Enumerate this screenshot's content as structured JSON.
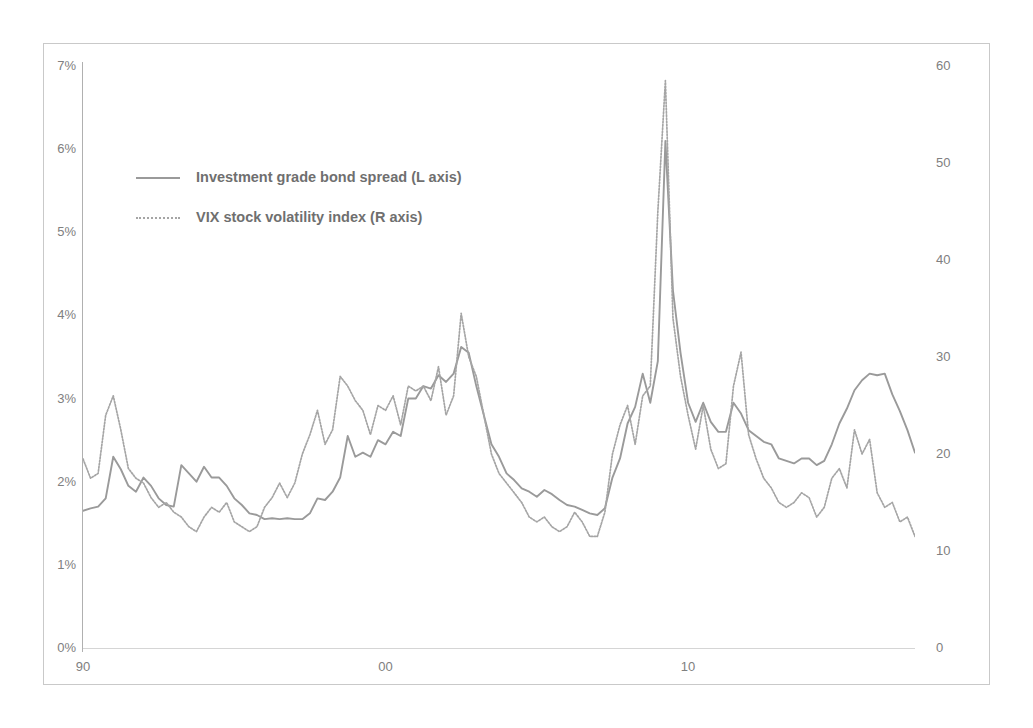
{
  "chart_data": {
    "type": "line",
    "title": "",
    "subtitle": "",
    "xlabel": "",
    "ylabel": "",
    "y2label": "",
    "grid": false,
    "legend_position": "inside-top-left",
    "x": [
      1990.0,
      1990.25,
      1990.5,
      1990.75,
      1991.0,
      1991.25,
      1991.5,
      1991.75,
      1992.0,
      1992.25,
      1992.5,
      1992.75,
      1993.0,
      1993.25,
      1993.5,
      1993.75,
      1994.0,
      1994.25,
      1994.5,
      1994.75,
      1995.0,
      1995.25,
      1995.5,
      1995.75,
      1996.0,
      1996.25,
      1996.5,
      1996.75,
      1997.0,
      1997.25,
      1997.5,
      1997.75,
      1998.0,
      1998.25,
      1998.5,
      1998.75,
      1999.0,
      1999.25,
      1999.5,
      1999.75,
      2000.0,
      2000.25,
      2000.5,
      2000.75,
      2001.0,
      2001.25,
      2001.5,
      2001.75,
      2002.0,
      2002.25,
      2002.5,
      2002.75,
      2003.0,
      2003.25,
      2003.5,
      2003.75,
      2004.0,
      2004.25,
      2004.5,
      2004.75,
      2005.0,
      2005.25,
      2005.5,
      2005.75,
      2006.0,
      2006.25,
      2006.5,
      2006.75,
      2007.0,
      2007.25,
      2007.5,
      2007.75,
      2008.0,
      2008.25,
      2008.5,
      2008.75,
      2009.0,
      2009.25,
      2009.5,
      2009.75,
      2010.0,
      2010.25,
      2010.5,
      2010.75,
      2011.0,
      2011.25,
      2011.5,
      2011.75,
      2012.0,
      2012.25,
      2012.5,
      2012.75,
      2013.0,
      2013.25,
      2013.5,
      2013.75,
      2014.0,
      2014.25,
      2014.5,
      2014.75,
      2015.0,
      2015.25,
      2015.5,
      2015.75,
      2016.0,
      2016.25,
      2016.5,
      2016.75,
      2017.0,
      2017.25,
      2017.5
    ],
    "xlim": [
      1990.0,
      2017.5
    ],
    "x_tick_values": [
      1990,
      2000,
      2010
    ],
    "x_tick_labels": [
      "90",
      "00",
      "10"
    ],
    "series": [
      {
        "name": "Investment grade bond spread (L axis)",
        "axis": "left",
        "style": "solid",
        "color": "#9a9a9a",
        "unit": "%",
        "values": [
          1.65,
          1.68,
          1.7,
          1.8,
          2.3,
          2.15,
          1.95,
          1.88,
          2.05,
          1.95,
          1.8,
          1.72,
          1.7,
          2.2,
          2.1,
          2.0,
          2.18,
          2.05,
          2.05,
          1.95,
          1.8,
          1.72,
          1.62,
          1.6,
          1.55,
          1.56,
          1.55,
          1.56,
          1.55,
          1.55,
          1.62,
          1.8,
          1.78,
          1.88,
          2.05,
          2.55,
          2.3,
          2.35,
          2.3,
          2.5,
          2.45,
          2.6,
          2.55,
          3.0,
          3.0,
          3.15,
          3.12,
          3.28,
          3.2,
          3.3,
          3.62,
          3.55,
          3.15,
          2.8,
          2.45,
          2.3,
          2.1,
          2.02,
          1.92,
          1.88,
          1.82,
          1.9,
          1.85,
          1.78,
          1.72,
          1.7,
          1.66,
          1.62,
          1.6,
          1.68,
          2.05,
          2.28,
          2.7,
          2.9,
          3.3,
          2.95,
          3.45,
          6.1,
          4.3,
          3.55,
          2.95,
          2.72,
          2.95,
          2.72,
          2.6,
          2.6,
          2.95,
          2.82,
          2.62,
          2.55,
          2.48,
          2.45,
          2.28,
          2.25,
          2.22,
          2.28,
          2.28,
          2.2,
          2.25,
          2.45,
          2.7,
          2.88,
          3.1,
          3.22,
          3.3,
          3.28,
          3.3,
          3.05,
          2.85,
          2.62,
          2.35
        ]
      },
      {
        "name": "VIX stock volatility index (R axis)",
        "axis": "right",
        "style": "dotted",
        "color": "#a5a5a5",
        "unit": "",
        "values": [
          19.5,
          17.5,
          18.0,
          24.0,
          26.0,
          22.5,
          18.5,
          17.5,
          17.0,
          15.5,
          14.5,
          15.0,
          14.0,
          13.5,
          12.5,
          12.0,
          13.5,
          14.5,
          14.0,
          15.0,
          13.0,
          12.5,
          12.0,
          12.5,
          14.5,
          15.5,
          17.0,
          15.5,
          17.0,
          20.0,
          22.0,
          24.5,
          21.0,
          22.5,
          28.0,
          27.0,
          25.5,
          24.5,
          22.0,
          25.0,
          24.5,
          26.0,
          23.0,
          27.0,
          26.5,
          27.0,
          25.5,
          29.0,
          24.0,
          26.0,
          34.5,
          30.0,
          28.0,
          24.0,
          20.0,
          18.0,
          17.0,
          16.0,
          15.0,
          13.5,
          13.0,
          13.5,
          12.5,
          12.0,
          12.5,
          14.0,
          13.0,
          11.5,
          11.5,
          14.0,
          20.0,
          23.0,
          25.0,
          21.0,
          26.0,
          27.0,
          45.0,
          58.5,
          34.0,
          28.0,
          24.0,
          20.5,
          25.0,
          20.5,
          18.5,
          19.0,
          27.0,
          30.5,
          22.0,
          19.5,
          17.5,
          16.5,
          15.0,
          14.5,
          15.0,
          16.0,
          15.5,
          13.5,
          14.5,
          17.5,
          18.5,
          16.5,
          22.5,
          20.0,
          21.5,
          16.0,
          14.5,
          15.0,
          13.0,
          13.5,
          11.5
        ]
      }
    ],
    "left_axis": {
      "ticks": [
        0,
        1,
        2,
        3,
        4,
        5,
        6,
        7
      ],
      "tick_labels": [
        "0%",
        "1%",
        "2%",
        "3%",
        "4%",
        "5%",
        "6%",
        "7%"
      ],
      "ylim": [
        0,
        7
      ]
    },
    "right_axis": {
      "ticks": [
        0,
        10,
        20,
        30,
        40,
        50,
        60
      ],
      "tick_labels": [
        "0",
        "10",
        "20",
        "30",
        "40",
        "50",
        "60"
      ],
      "ylim": [
        0,
        60
      ]
    },
    "legend": [
      {
        "label": "Investment grade bond spread (L axis)",
        "style": "solid"
      },
      {
        "label": "VIX stock volatility index (R axis)",
        "style": "dotted"
      }
    ],
    "annotations": []
  },
  "colors": {
    "series_solid": "#9a9a9a",
    "series_dotted": "#a5a5a5",
    "axis_text": "#808080",
    "legend_text": "#6f6f6f",
    "frame": "#c9c9c9",
    "background": "#ffffff"
  }
}
